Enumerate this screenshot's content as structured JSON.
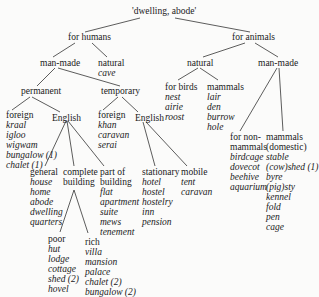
{
  "root": {
    "label": "'dwelling, abode'"
  },
  "for_humans": {
    "label": "for humans"
  },
  "for_animals": {
    "label": "for animals"
  },
  "h_manmade": {
    "label": "man-made"
  },
  "h_natural": {
    "label": "natural",
    "words": [
      "cave"
    ]
  },
  "permanent": {
    "label": "permanent"
  },
  "temporary": {
    "label": "temporary"
  },
  "perm_foreign": {
    "label": "foreign",
    "words": [
      "kraal",
      "igloo",
      "wigwam",
      "bungalow (1)",
      "chalet (1)"
    ]
  },
  "perm_english": {
    "label": "English"
  },
  "temp_foreign": {
    "label": "foreign",
    "words": [
      "khan",
      "caravan",
      "serai"
    ]
  },
  "temp_english": {
    "label": "English"
  },
  "general": {
    "label": "general",
    "words": [
      "house",
      "home",
      "abode",
      "dwelling",
      "quarters"
    ]
  },
  "complete": {
    "label1": "complete",
    "label2": "building"
  },
  "part": {
    "label1": "part of",
    "label2": "building",
    "words": [
      "flat",
      "apartment",
      "suite",
      "mews",
      "tenement"
    ]
  },
  "stationary": {
    "label": "stationary",
    "words": [
      "hotel",
      "hostel",
      "hostelry",
      "inn",
      "pension"
    ]
  },
  "mobile": {
    "label": "mobile",
    "words": [
      "tent",
      "caravan"
    ]
  },
  "poor": {
    "label": "poor",
    "words": [
      "hut",
      "lodge",
      "cottage",
      "shed (2)",
      "hovel"
    ]
  },
  "rich": {
    "label": "rich",
    "words": [
      "villa",
      "mansion",
      "palace",
      "chalet (2)",
      "bungalow (2)"
    ]
  },
  "a_natural": {
    "label": "natural"
  },
  "a_manmade": {
    "label": "man-made"
  },
  "for_birds": {
    "label": "for birds",
    "words": [
      "nest",
      "airie",
      "roost"
    ]
  },
  "a_mammals": {
    "label": "mammals",
    "words": [
      "lair",
      "den",
      "burrow",
      "hole"
    ]
  },
  "non_mammals": {
    "label1": "for non-",
    "label2": "mammals",
    "words": [
      "birdcage",
      "dovecot",
      "beehive",
      "aquarium"
    ]
  },
  "dom_mammals": {
    "label1": "mammals",
    "label2": "(domestic)",
    "words": [
      "stable",
      "(cow)shed (1)",
      "byre",
      "(pig)sty",
      "kennel",
      "fold",
      "pen",
      "cage"
    ]
  }
}
